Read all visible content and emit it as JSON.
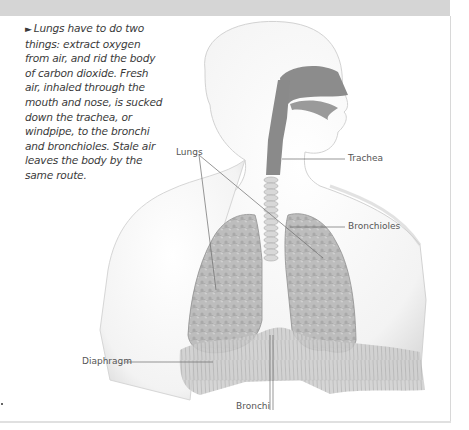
{
  "caption": {
    "arrow_icon": "►",
    "text": "Lungs have to do two things: extract oxygen from air, and rid the body of carbon dioxide. Fresh air, inhaled through the mouth and nose, is sucked down the trachea, or windpipe, to the bronchi and bronchioles. Stale air leaves the body by the same route."
  },
  "labels": {
    "lungs": "Lungs",
    "trachea": "Trachea",
    "bronchioles": "Bronchioles",
    "diaphragm": "Diaphragm",
    "bronchi": "Bronchi"
  },
  "colors": {
    "top_band": "#d5d5d5",
    "airway": "#8a8a8a",
    "lung_tissue": "#b8b8b8",
    "body_outline": "#cfcfcf"
  }
}
